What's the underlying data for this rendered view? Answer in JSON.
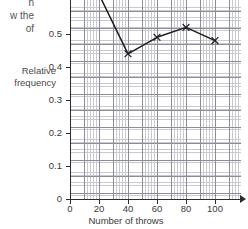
{
  "question_stem": {
    "line1": "n",
    "line2": "w the",
    "line3": "of"
  },
  "axes": {
    "y_title_line1": "Relative",
    "y_title_line2": "frequency",
    "x_title": "Number of throws",
    "y_ticks": [
      "0.5",
      "0.4",
      "0.3",
      "0.2",
      "0.1",
      "0"
    ],
    "x_ticks": [
      "0",
      "20",
      "40",
      "60",
      "80",
      "100"
    ]
  },
  "colors": {
    "line": "#1d1d1d",
    "grid_minor": "#c9c9d2",
    "grid_major": "#8d8d98",
    "axis": "#2c2c2c",
    "text": "#3a3a3a",
    "background": "#ffffff"
  },
  "chart_data": {
    "type": "line",
    "title": "",
    "xlabel": "Number of throws",
    "ylabel": "Relative frequency",
    "xlim": [
      0,
      110
    ],
    "ylim": [
      0,
      0.56
    ],
    "xticks": [
      0,
      20,
      40,
      60,
      80,
      100
    ],
    "yticks": [
      0,
      0.1,
      0.2,
      0.3,
      0.4,
      0.5
    ],
    "grid": true,
    "legend": "none",
    "marker": "cross",
    "note": "First plotted point at x=20 lies above the visible crop; the line enters the frame from the top-left.",
    "x": [
      20,
      40,
      60,
      80,
      100
    ],
    "y": [
      0.62,
      0.44,
      0.49,
      0.52,
      0.48
    ],
    "series": [
      {
        "name": "Relative frequency",
        "points": [
          {
            "x": 20,
            "y": 0.62,
            "visible": false
          },
          {
            "x": 40,
            "y": 0.44,
            "visible": true
          },
          {
            "x": 60,
            "y": 0.49,
            "visible": true
          },
          {
            "x": 80,
            "y": 0.52,
            "visible": true
          },
          {
            "x": 100,
            "y": 0.48,
            "visible": true
          }
        ]
      }
    ]
  }
}
